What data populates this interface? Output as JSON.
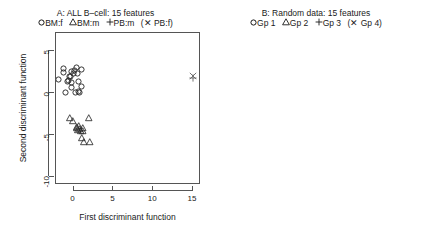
{
  "figure": {
    "panels": [
      {
        "id": "A",
        "title": "A: ALL B–cell: 15 features",
        "legend": [
          {
            "glyph": "circle",
            "label": "BM:f"
          },
          {
            "glyph": "triangle",
            "label": "BM:m"
          },
          {
            "glyph": "plus",
            "label": "PB:m"
          },
          {
            "glyph": "cross",
            "label": "(✕ PB:f)",
            "parenthetical": true
          }
        ],
        "xlabel": "First discriminant function",
        "ylabel": "Second discriminant function",
        "xticks": [
          0,
          5,
          10,
          15
        ],
        "yticks": [
          5,
          0,
          -5,
          -10
        ],
        "xlim": [
          -2.2,
          16.0
        ],
        "ylim": [
          -11.0,
          7.2
        ]
      },
      {
        "id": "B",
        "title": "B: Random data: 15 features",
        "legend": [
          {
            "glyph": "circle",
            "label": "Gp 1"
          },
          {
            "glyph": "triangle",
            "label": "Gp 2"
          },
          {
            "glyph": "plus",
            "label": "Gp 3"
          },
          {
            "glyph": "cross",
            "label": "(✕ Gp 4)",
            "parenthetical": true
          }
        ],
        "xlabel": "First discriminant function",
        "ylabel": "",
        "xticks": [
          -4,
          -2,
          0,
          2,
          4,
          6,
          8
        ],
        "yticks": [
          8,
          6,
          4,
          2,
          0,
          -2,
          -4
        ],
        "xlim": [
          -5.6,
          9.2
        ],
        "ylim": [
          -5.4,
          9.0
        ]
      }
    ]
  },
  "chart_data": [
    {
      "type": "scatter",
      "panel": "A",
      "title": "A: ALL B–cell: 15 features",
      "xlabel": "First discriminant function",
      "ylabel": "Second discriminant function",
      "xlim": [
        -2.2,
        16.0
      ],
      "ylim": [
        -11.0,
        7.2
      ],
      "xticks": [
        0,
        5,
        10,
        15
      ],
      "yticks": [
        5,
        0,
        -5,
        -10
      ],
      "grid": false,
      "legend_position": "top",
      "series": [
        {
          "name": "BM:f",
          "marker": "circle",
          "points": [
            [
              -1.95,
              1.6
            ],
            [
              -1.3,
              2.95
            ],
            [
              -1.25,
              2.45
            ],
            [
              -0.95,
              0.1
            ],
            [
              -0.7,
              1.35
            ],
            [
              -0.6,
              1.55
            ],
            [
              -0.45,
              1.95
            ],
            [
              -0.35,
              2.05
            ],
            [
              -0.3,
              1.25
            ],
            [
              -0.25,
              0.65
            ],
            [
              -0.2,
              2.6
            ],
            [
              0.05,
              2.3
            ],
            [
              0.15,
              2.7
            ],
            [
              0.2,
              0.05
            ],
            [
              0.35,
              3.05
            ],
            [
              0.55,
              2.4
            ],
            [
              0.6,
              1.45
            ],
            [
              0.65,
              0.15
            ],
            [
              0.7,
              0.05
            ],
            [
              0.95,
              2.85
            ],
            [
              1.05,
              0.75
            ]
          ]
        },
        {
          "name": "BM:m",
          "marker": "triangle",
          "points": [
            [
              -0.45,
              -2.95
            ],
            [
              -0.1,
              -3.25
            ],
            [
              0.35,
              -4.0
            ],
            [
              0.45,
              -4.1
            ],
            [
              0.55,
              -4.35
            ],
            [
              0.6,
              -3.85
            ],
            [
              0.75,
              -4.25
            ],
            [
              0.95,
              -4.45
            ],
            [
              1.0,
              -5.35
            ],
            [
              1.1,
              -4.15
            ],
            [
              1.2,
              -4.55
            ],
            [
              1.25,
              -5.85
            ],
            [
              2.0,
              -5.85
            ],
            [
              1.85,
              -2.9
            ]
          ]
        },
        {
          "name": "PB:m",
          "marker": "plus",
          "points": [
            [
              15.0,
              1.85
            ]
          ]
        },
        {
          "name": "PB:f",
          "marker": "cross",
          "points": [
            [
              15.0,
              2.05
            ]
          ]
        }
      ]
    },
    {
      "type": "scatter",
      "panel": "B",
      "title": "B: Random data: 15 features",
      "xlabel": "First discriminant function",
      "ylabel": "",
      "xlim": [
        -5.6,
        9.2
      ],
      "ylim": [
        -5.4,
        9.0
      ],
      "xticks": [
        -4,
        -2,
        0,
        2,
        4,
        6,
        8
      ],
      "yticks": [
        8,
        6,
        4,
        2,
        0,
        -2,
        -4
      ],
      "grid": false,
      "legend_position": "top",
      "series": [
        {
          "name": "Gp 1",
          "marker": "circle",
          "points": [
            [
              -4.45,
              -0.35
            ],
            [
              -4.25,
              -0.55
            ],
            [
              -4.05,
              -1.55
            ],
            [
              -3.95,
              -0.4
            ],
            [
              -3.85,
              -1.75
            ],
            [
              -3.7,
              -0.3
            ],
            [
              -3.6,
              -1.95
            ],
            [
              -3.45,
              0.05
            ],
            [
              -3.4,
              -0.55
            ],
            [
              -3.3,
              0.45
            ],
            [
              -3.05,
              0.55
            ],
            [
              -3.0,
              -0.1
            ],
            [
              -2.95,
              0.8
            ],
            [
              -2.9,
              -1.45
            ],
            [
              -2.75,
              0.6
            ],
            [
              -2.7,
              -1.55
            ],
            [
              -2.6,
              0.95
            ],
            [
              -2.55,
              -1.3
            ],
            [
              -2.45,
              0.35
            ]
          ]
        },
        {
          "name": "Gp 2",
          "marker": "triangle",
          "points": [
            [
              2.15,
              -2.25
            ],
            [
              3.25,
              -1.55
            ],
            [
              3.3,
              -2.1
            ],
            [
              3.35,
              -2.4
            ],
            [
              3.4,
              -2.9
            ],
            [
              3.45,
              0.35
            ],
            [
              3.5,
              -0.6
            ],
            [
              4.0,
              -2.2
            ],
            [
              4.75,
              -2.3
            ],
            [
              5.7,
              -2.25
            ],
            [
              6.45,
              -3.95
            ]
          ]
        },
        {
          "name": "Gp 3",
          "marker": "plus",
          "points": [
            [
              5.85,
              7.05
            ],
            [
              7.8,
              7.95
            ]
          ]
        },
        {
          "name": "Gp 4",
          "marker": "cross",
          "points": [
            [
              2.85,
              0.25
            ]
          ]
        }
      ]
    }
  ]
}
